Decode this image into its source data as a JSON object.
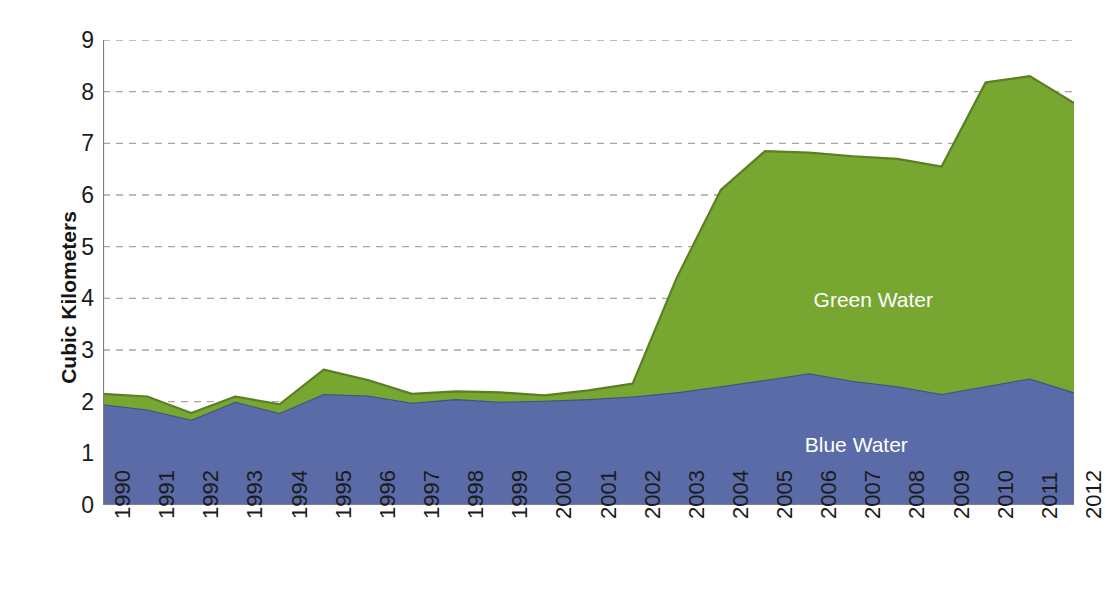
{
  "chart_data": {
    "type": "area",
    "stacked": true,
    "title": "",
    "subtitle": "",
    "xlabel": "",
    "ylabel": "Cubic Kilometers",
    "ylim": [
      0,
      9
    ],
    "ytick_step": 1,
    "yticks": [
      "0",
      "1",
      "2",
      "3",
      "4",
      "5",
      "6",
      "7",
      "8",
      "9"
    ],
    "grid": "horizontal-dashed",
    "legend_position": "in-plot-annotations",
    "categories": [
      "1990",
      "1991",
      "1992",
      "1993",
      "1994",
      "1995",
      "1996",
      "1997",
      "1998",
      "1999",
      "2000",
      "2001",
      "2002",
      "2003",
      "2004",
      "2005",
      "2006",
      "2007",
      "2008",
      "2009",
      "2010",
      "2011",
      "2012"
    ],
    "x": [
      1990,
      1991,
      1992,
      1993,
      1994,
      1995,
      1996,
      1997,
      1998,
      1999,
      2000,
      2001,
      2002,
      2003,
      2004,
      2005,
      2006,
      2007,
      2008,
      2009,
      2010,
      2011,
      2012
    ],
    "series": [
      {
        "name": "Blue Water",
        "color": "#5a6ba8",
        "edge_color": "#3e4f8c",
        "values": [
          1.95,
          1.85,
          1.65,
          2.0,
          1.78,
          2.15,
          2.12,
          1.98,
          2.05,
          2.0,
          2.02,
          2.05,
          2.1,
          2.18,
          2.3,
          2.42,
          2.55,
          2.4,
          2.3,
          2.15,
          2.3,
          2.45,
          2.18
        ]
      },
      {
        "name": "Green Water",
        "color": "#77a631",
        "edge_color": "#5b7f22",
        "values": [
          0.2,
          0.25,
          0.13,
          0.1,
          0.17,
          0.47,
          0.3,
          0.17,
          0.15,
          0.18,
          0.1,
          0.17,
          0.25,
          2.22,
          3.8,
          4.43,
          4.27,
          4.35,
          4.4,
          4.4,
          5.88,
          5.85,
          5.6
        ]
      }
    ],
    "cumulative_totals": [
      2.15,
      2.1,
      1.78,
      2.1,
      1.95,
      2.62,
      2.42,
      2.15,
      2.2,
      2.18,
      2.12,
      2.22,
      2.35,
      4.4,
      6.1,
      6.85,
      6.82,
      6.75,
      6.7,
      6.55,
      8.18,
      8.3,
      7.78
    ],
    "annotations": [
      {
        "name": "green-water-label",
        "text": "Green Water",
        "x_value": 2006.1,
        "y_value": 3.95
      },
      {
        "name": "blue-water-label",
        "text": "Blue Water",
        "x_value": 2005.9,
        "y_value": 1.15
      }
    ]
  },
  "axes": {
    "y_title": "Cubic Kilometers",
    "axis_color": "#808080",
    "gridline_color": "#a6a6a6",
    "tick_label_color": "#1b1b1b"
  }
}
